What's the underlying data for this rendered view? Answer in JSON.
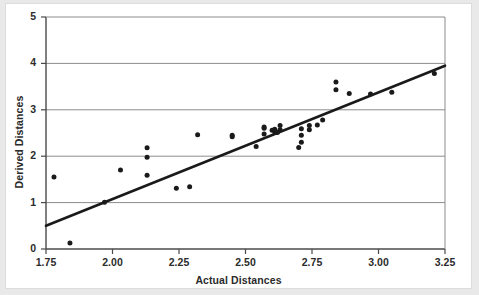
{
  "chart_data": {
    "type": "scatter",
    "title": "",
    "xlabel": "Actual Distances",
    "ylabel": "Derived Distances",
    "xlim": [
      1.75,
      3.25
    ],
    "ylim": [
      0,
      5
    ],
    "xticks": [
      "1.75",
      "2.00",
      "2.25",
      "2.50",
      "2.75",
      "3.00",
      "3.25"
    ],
    "xtick_values": [
      1.75,
      2.0,
      2.25,
      2.5,
      2.75,
      3.0,
      3.25
    ],
    "yticks": [
      "0",
      "1",
      "2",
      "3",
      "4",
      "5"
    ],
    "ytick_values": [
      0,
      1,
      2,
      3,
      4,
      5
    ],
    "grid": "horizontal",
    "gridlines_y": [
      1,
      2,
      3,
      4
    ],
    "legend": "none",
    "marker_color": "#1a1a1a",
    "line_color": "#1a1a1a",
    "grid_color": "#8c8c8c",
    "axis_color": "#6e6e6e",
    "background_color": "#ffffff",
    "page_color": "#e9e9e9",
    "series": [
      {
        "name": "observations",
        "x": [
          1.78,
          1.84,
          1.97,
          2.03,
          2.13,
          2.13,
          2.13,
          2.24,
          2.29,
          2.32,
          2.45,
          2.45,
          2.54,
          2.57,
          2.57,
          2.57,
          2.6,
          2.61,
          2.61,
          2.62,
          2.63,
          2.63,
          2.7,
          2.71,
          2.71,
          2.71,
          2.74,
          2.74,
          2.77,
          2.79,
          2.84,
          2.84,
          2.89,
          2.97,
          3.05,
          3.21
        ],
        "y": [
          1.55,
          0.13,
          1.01,
          1.7,
          2.18,
          1.98,
          1.59,
          1.31,
          1.34,
          2.46,
          2.45,
          2.42,
          2.21,
          2.63,
          2.6,
          2.48,
          2.56,
          2.58,
          2.52,
          2.51,
          2.66,
          2.57,
          2.19,
          2.59,
          2.45,
          2.3,
          2.57,
          2.66,
          2.67,
          2.78,
          3.6,
          3.43,
          3.35,
          3.34,
          3.38,
          3.78
        ]
      }
    ],
    "trend_line": {
      "name": "fitted line",
      "x": [
        1.75,
        3.25
      ],
      "y": [
        0.5,
        3.95
      ]
    }
  }
}
